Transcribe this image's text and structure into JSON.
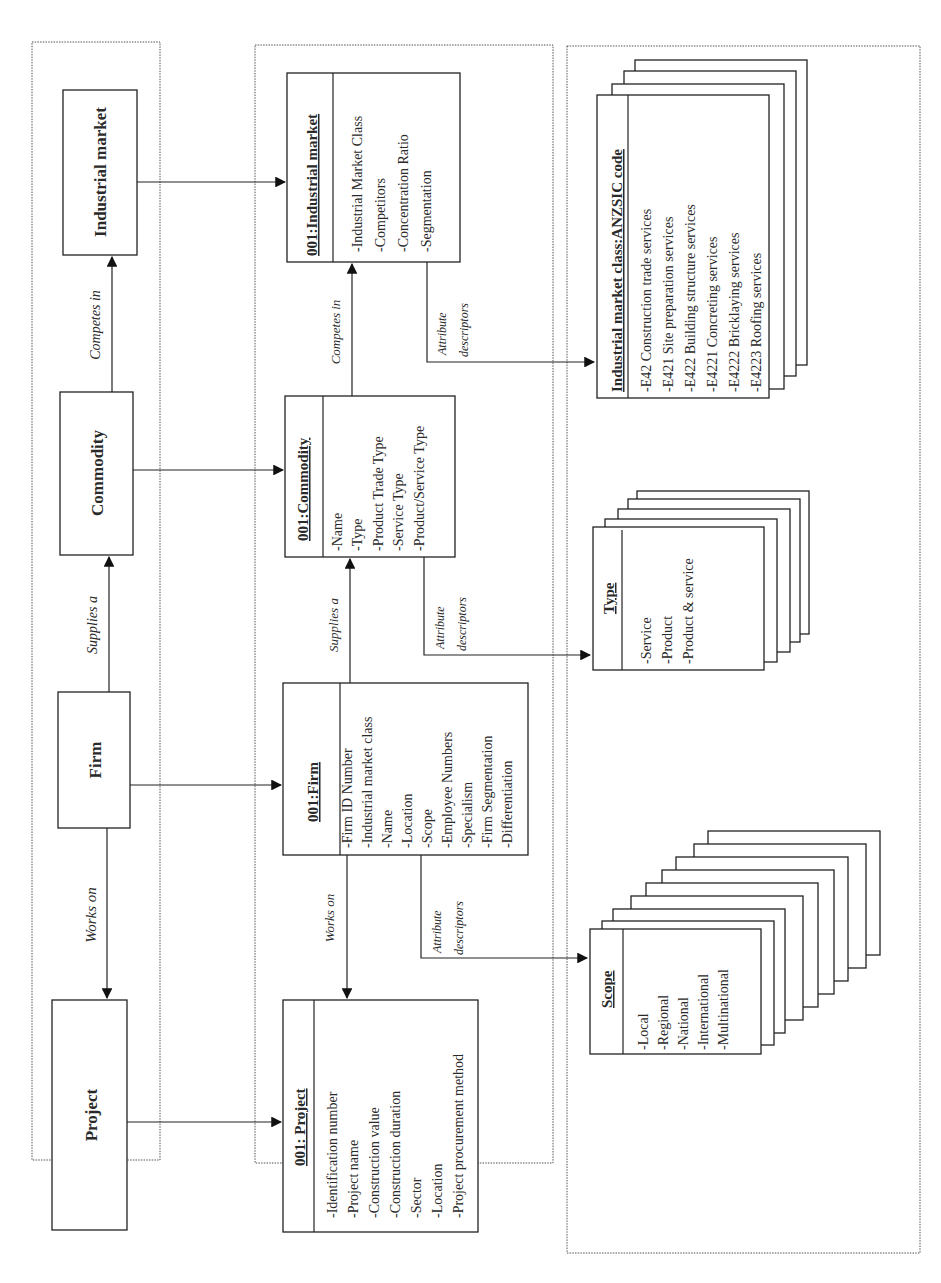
{
  "left_panel": {
    "entities": [
      {
        "id": "industrial_market",
        "label": "Industrial market"
      },
      {
        "id": "commodity",
        "label": "Commodity"
      },
      {
        "id": "firm",
        "label": "Firm"
      },
      {
        "id": "project",
        "label": "Project"
      }
    ],
    "relations": [
      {
        "label": "Competes in",
        "from": "Commodity",
        "to": "Industrial market"
      },
      {
        "label": "Supplies a",
        "from": "Firm",
        "to": "Commodity"
      },
      {
        "label": "Works on",
        "from": "Firm",
        "to": "Project"
      }
    ]
  },
  "middle_panel": {
    "classes": [
      {
        "title": "001:Industrial market",
        "attributes": [
          "-Industrial Market Class",
          "-Competitors",
          "-Concentration Ratio",
          "-Segmentation"
        ]
      },
      {
        "title": "001:Commodity",
        "attributes": [
          "-Name",
          "-Type",
          "-Product Trade Type",
          "-Service Type",
          "-Product/Service Type"
        ]
      },
      {
        "title": "001:Firm",
        "attributes": [
          "-Firm ID Number",
          "-Industrial market class",
          "-Name",
          "-Location",
          "-Scope",
          "-Employee Numbers",
          "-Specialism",
          "-Firm Segmentation",
          "-Differentiation"
        ]
      },
      {
        "title": "001: Project",
        "attributes": [
          "-Identification number",
          "-Project name",
          "-Construction value",
          "-Construction duration",
          "-Sector",
          "-Location",
          "-Project procurement method"
        ]
      }
    ],
    "relations": [
      {
        "label": "Competes in"
      },
      {
        "label": "Supplies a"
      },
      {
        "label": "Works on"
      }
    ],
    "descriptor_label_line1": "Attribute",
    "descriptor_label_line2": "descriptors"
  },
  "right_panel": {
    "stacks": [
      {
        "title": "Industrial market class:ANZSIC code",
        "items": [
          "-E42 Construction trade services",
          "-E421 Site preparation services",
          "-E422 Building structure services",
          "-E4221 Concreting services",
          "-E4222 Bricklaying services",
          "-E4223 Roofing services"
        ],
        "card_count": 4
      },
      {
        "title": "Type",
        "items": [
          "-Service",
          "-Product",
          "-Product & service"
        ],
        "card_count": 5
      },
      {
        "title": "Scope",
        "items": [
          "-Local",
          "-Regional",
          "-National",
          "-International",
          "-Multinational"
        ],
        "card_count": 9
      }
    ]
  }
}
